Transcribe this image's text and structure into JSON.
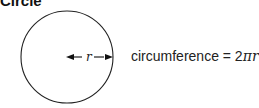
{
  "title": "Circle",
  "diagram": {
    "radius_label": "r",
    "formula_prefix": "circumference = 2",
    "formula_pi": "π",
    "formula_var": "r"
  }
}
